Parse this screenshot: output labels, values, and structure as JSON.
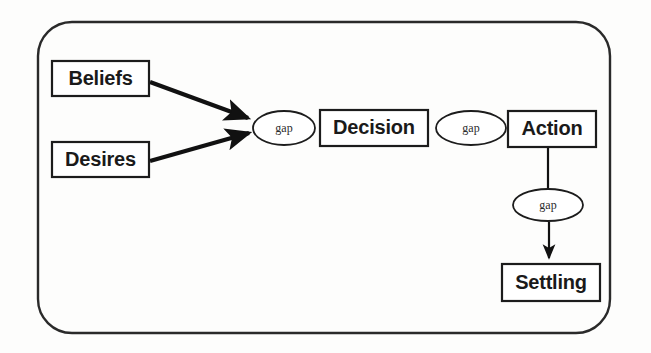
{
  "diagram": {
    "frame": {
      "name": "outer-rounded-frame",
      "x": 38,
      "y": 22,
      "width": 572,
      "height": 311,
      "radius": 34,
      "stroke_color": "#2a2a2a"
    },
    "nodes": [
      {
        "id": "beliefs",
        "label": "Beliefs",
        "shape": "rect",
        "x": 52,
        "y": 61,
        "width": 97,
        "height": 35
      },
      {
        "id": "desires",
        "label": "Desires",
        "shape": "rect",
        "x": 52,
        "y": 142,
        "width": 97,
        "height": 35
      },
      {
        "id": "decision",
        "label": "Decision",
        "shape": "rect",
        "x": 320,
        "y": 110,
        "width": 108,
        "height": 36
      },
      {
        "id": "action",
        "label": "Action",
        "shape": "rect",
        "x": 508,
        "y": 111,
        "width": 88,
        "height": 36
      },
      {
        "id": "settling",
        "label": "Settling",
        "shape": "rect",
        "x": 502,
        "y": 264,
        "width": 98,
        "height": 37
      }
    ],
    "gaps": [
      {
        "id": "gap-1",
        "label": "gap",
        "shape": "ellipse",
        "cx": 284,
        "cy": 128,
        "rx": 31,
        "ry": 17
      },
      {
        "id": "gap-2",
        "label": "gap",
        "shape": "ellipse",
        "cx": 471,
        "cy": 128,
        "rx": 35,
        "ry": 17
      },
      {
        "id": "gap-3",
        "label": "gap",
        "shape": "ellipse",
        "cx": 548,
        "cy": 205,
        "rx": 35,
        "ry": 16
      }
    ],
    "connectors": [
      {
        "id": "beliefs-to-gap1",
        "from": "beliefs",
        "to": "gap-1",
        "style": "arrow",
        "weight": "thick"
      },
      {
        "id": "desires-to-gap1",
        "from": "desires",
        "to": "gap-1",
        "style": "arrow",
        "weight": "thick"
      },
      {
        "id": "action-to-gap3",
        "from": "action",
        "to": "gap-3",
        "style": "line",
        "weight": "thin"
      },
      {
        "id": "gap3-to-settling",
        "from": "gap-3",
        "to": "settling",
        "style": "arrow",
        "weight": "thin"
      }
    ],
    "colors": {
      "background": "#fdfdfc",
      "stroke": "#1c1c1c",
      "text": "#1a1a1a"
    }
  }
}
